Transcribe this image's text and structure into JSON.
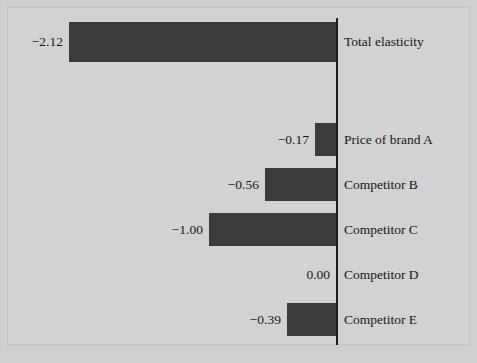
{
  "chart_data": {
    "type": "bar",
    "orientation": "horizontal",
    "title": "",
    "subtitle": "",
    "xlabel": "",
    "ylabel": "",
    "grid": false,
    "legend": null,
    "zero_axis": true,
    "xlim": [
      -2.12,
      0
    ],
    "axis_direction": "negative-left",
    "categories": [
      "Total elasticity",
      "Price of brand A",
      "Competitor B",
      "Competitor C",
      "Competitor D",
      "Competitor E"
    ],
    "values": [
      -2.12,
      -0.17,
      -0.56,
      -1.0,
      0.0,
      -0.39
    ],
    "value_labels": [
      "−2.12",
      "−0.17",
      "−0.56",
      "−1.00",
      "0.00",
      "−0.39"
    ],
    "bars": [
      {
        "category": "Total elasticity",
        "value": -2.12,
        "label": "−2.12",
        "left": 69,
        "width": 267,
        "top": 22,
        "height": 40,
        "label_right_edge": 63
      },
      {
        "category": "Price of brand A",
        "value": -0.17,
        "label": "−0.17",
        "left": 315,
        "width": 21,
        "top": 123,
        "height": 33,
        "label_right_edge": 309
      },
      {
        "category": "Competitor B",
        "value": -0.56,
        "label": "−0.56",
        "left": 265,
        "width": 71,
        "top": 168,
        "height": 33,
        "label_right_edge": 259
      },
      {
        "category": "Competitor C",
        "value": -1.0,
        "label": "−1.00",
        "left": 209,
        "width": 127,
        "top": 213,
        "height": 33,
        "label_right_edge": 203
      },
      {
        "category": "Competitor D",
        "value": 0.0,
        "label": "0.00",
        "left": 336,
        "width": 0,
        "top": 258,
        "height": 33,
        "label_right_edge": 330
      },
      {
        "category": "Competitor E",
        "value": -0.39,
        "label": "−0.39",
        "left": 287,
        "width": 49,
        "top": 303,
        "height": 33,
        "label_right_edge": 281
      }
    ],
    "colors": {
      "bar": "#3c3c3c",
      "background": "#d2d2d2",
      "canvas": "#cfcfcf",
      "axis": "#1e1e1e",
      "text": "#171717"
    }
  }
}
